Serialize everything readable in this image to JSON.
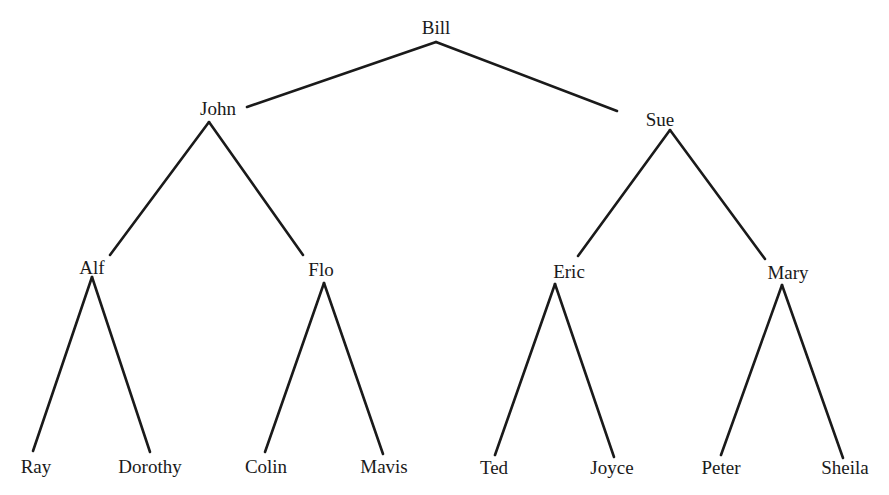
{
  "diagram": {
    "type": "family-tree",
    "nodes": {
      "bill": {
        "label": "Bill",
        "x": 436,
        "y": 18
      },
      "john": {
        "label": "John",
        "x": 218,
        "y": 99
      },
      "sue": {
        "label": "Sue",
        "x": 660,
        "y": 110
      },
      "alf": {
        "label": "Alf",
        "x": 92,
        "y": 258
      },
      "flo": {
        "label": "Flo",
        "x": 321,
        "y": 260
      },
      "eric": {
        "label": "Eric",
        "x": 569,
        "y": 262
      },
      "mary": {
        "label": "Mary",
        "x": 788,
        "y": 263
      },
      "ray": {
        "label": "Ray",
        "x": 36,
        "y": 457
      },
      "dorothy": {
        "label": "Dorothy",
        "x": 150,
        "y": 457
      },
      "colin": {
        "label": "Colin",
        "x": 266,
        "y": 457
      },
      "mavis": {
        "label": "Mavis",
        "x": 384,
        "y": 457
      },
      "ted": {
        "label": "Ted",
        "x": 494,
        "y": 458
      },
      "joyce": {
        "label": "Joyce",
        "x": 612,
        "y": 458
      },
      "peter": {
        "label": "Peter",
        "x": 721,
        "y": 458
      },
      "sheila": {
        "label": "Sheila",
        "x": 845,
        "y": 458
      }
    },
    "edges": [
      {
        "from": "Bill",
        "to": "John",
        "x1": 436,
        "y1": 42,
        "x2": 247,
        "y2": 107
      },
      {
        "from": "Bill",
        "to": "Sue",
        "x1": 436,
        "y1": 42,
        "x2": 617,
        "y2": 111
      },
      {
        "from": "John",
        "to": "Alf",
        "x1": 209,
        "y1": 122,
        "x2": 110,
        "y2": 255
      },
      {
        "from": "John",
        "to": "Flo",
        "x1": 209,
        "y1": 122,
        "x2": 303,
        "y2": 255
      },
      {
        "from": "Sue",
        "to": "Eric",
        "x1": 670,
        "y1": 130,
        "x2": 578,
        "y2": 256
      },
      {
        "from": "Sue",
        "to": "Mary",
        "x1": 670,
        "y1": 130,
        "x2": 765,
        "y2": 259
      },
      {
        "from": "Alf",
        "to": "Ray",
        "x1": 92,
        "y1": 277,
        "x2": 33,
        "y2": 451
      },
      {
        "from": "Alf",
        "to": "Dorothy",
        "x1": 92,
        "y1": 277,
        "x2": 150,
        "y2": 452
      },
      {
        "from": "Flo",
        "to": "Colin",
        "x1": 324,
        "y1": 283,
        "x2": 265,
        "y2": 452
      },
      {
        "from": "Flo",
        "to": "Mavis",
        "x1": 324,
        "y1": 283,
        "x2": 383,
        "y2": 454
      },
      {
        "from": "Eric",
        "to": "Ted",
        "x1": 555,
        "y1": 284,
        "x2": 495,
        "y2": 455
      },
      {
        "from": "Eric",
        "to": "Joyce",
        "x1": 555,
        "y1": 284,
        "x2": 614,
        "y2": 457
      },
      {
        "from": "Mary",
        "to": "Peter",
        "x1": 782,
        "y1": 285,
        "x2": 721,
        "y2": 455
      },
      {
        "from": "Mary",
        "to": "Sheila",
        "x1": 782,
        "y1": 285,
        "x2": 843,
        "y2": 458
      }
    ],
    "colors": {
      "line": "#1a1a1a",
      "text": "#1a1a1a",
      "background": "#ffffff"
    }
  }
}
